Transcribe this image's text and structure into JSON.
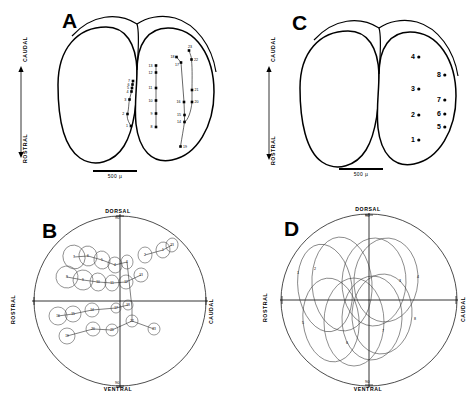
{
  "figure": {
    "panels": [
      "A",
      "B",
      "C",
      "D"
    ],
    "scale_bar_label": "500 µ"
  },
  "panel_a": {
    "letter": "A",
    "axis_top_label": "CAUDAL",
    "axis_bottom_label": "ROSTRAL",
    "scale_label": "500 µ",
    "view": "dorsal view of optic tectum with electrode penetration sites",
    "sites": [
      {
        "n": "1",
        "x": 131.0,
        "y": 126.0,
        "lx": -5.0,
        "ly": 1.2
      },
      {
        "n": "2",
        "x": 127.5,
        "y": 114.0,
        "lx": -5.2,
        "ly": 1.2
      },
      {
        "n": "3",
        "x": 129.5,
        "y": 99.5,
        "lx": -5.2,
        "ly": 1.2
      },
      {
        "n": "4",
        "x": 131.5,
        "y": 91.5,
        "lx": -5.0,
        "ly": 1.2
      },
      {
        "n": "5",
        "x": 132.0,
        "y": 88.0,
        "lx": -5.0,
        "ly": 1.2
      },
      {
        "n": "6",
        "x": 132.5,
        "y": 84.5,
        "lx": -5.0,
        "ly": 1.2
      },
      {
        "n": "7",
        "x": 133.0,
        "y": 81.0,
        "lx": -5.0,
        "ly": 1.2
      },
      {
        "n": "8",
        "x": 156.0,
        "y": 127.0,
        "lx": -5.6,
        "ly": 1.2
      },
      {
        "n": "9",
        "x": 156.0,
        "y": 113.5,
        "lx": -5.6,
        "ly": 1.2
      },
      {
        "n": "10",
        "x": 156.0,
        "y": 100.5,
        "lx": -7.4,
        "ly": 1.2
      },
      {
        "n": "11",
        "x": 156.0,
        "y": 88.0,
        "lx": -7.4,
        "ly": 1.2
      },
      {
        "n": "12",
        "x": 156.0,
        "y": 72.5,
        "lx": -7.4,
        "ly": 1.2
      },
      {
        "n": "13",
        "x": 156.0,
        "y": 65.5,
        "lx": -7.4,
        "ly": 1.2
      },
      {
        "n": "14",
        "x": 184.5,
        "y": 122.0,
        "lx": -7.6,
        "ly": 1.2
      },
      {
        "n": "15",
        "x": 184.5,
        "y": 115.0,
        "lx": -7.6,
        "ly": 1.2
      },
      {
        "n": "16",
        "x": 184.0,
        "y": 102.0,
        "lx": -7.6,
        "ly": 1.2
      },
      {
        "n": "17",
        "x": 181.0,
        "y": 62.5,
        "lx": -6.0,
        "ly": 3.0
      },
      {
        "n": "18",
        "x": 176.5,
        "y": 57.0,
        "lx": -6.0,
        "ly": 0.5
      },
      {
        "n": "19",
        "x": 180.5,
        "y": 146.5,
        "lx": 2.6,
        "ly": 1.6
      },
      {
        "n": "20",
        "x": 192.0,
        "y": 102.0,
        "lx": 2.6,
        "ly": 1.4
      },
      {
        "n": "21",
        "x": 192.0,
        "y": 90.0,
        "lx": 2.6,
        "ly": 1.4
      },
      {
        "n": "22",
        "x": 191.5,
        "y": 59.5,
        "lx": 2.6,
        "ly": 1.6
      },
      {
        "n": "23",
        "x": 189.0,
        "y": 50.5,
        "lx": -1.0,
        "ly": -2.4
      }
    ],
    "tracks": [
      "M131,126 C128.5,122 126.5,118 127.5,114 C129,108 128.5,104 129.5,99.5 L131.5,91.5 L132,88 L132.5,84.5 L133,81",
      "M156,127 L156,65.5",
      "M180.5,146.5 C182,137 183.5,129 184.5,122 L184.5,115 L184,102 L181,62.5 L176.5,57",
      "M189,50.5 C190.5,55 191.5,57 191.5,59.5 C192.5,70 192,82 192,90 L192,102 C191,112 188,120 184.5,122",
      "M176.5,57 L181,62.5"
    ]
  },
  "panel_b": {
    "letter": "B",
    "axis_top_label": "DORSAL",
    "axis_top_sub": "90",
    "axis_bottom_label": "VENTRAL",
    "axis_bottom_sub": "90",
    "axis_left_label": "ROSTRAL",
    "axis_right_label": "CAUDAL",
    "description": "visual field plot of receptive fields numbered to match panel A penetrations",
    "fields": [
      {
        "n": "7",
        "cx": 54,
        "cy": 45,
        "rx": 11,
        "ry": 12,
        "rot": -18
      },
      {
        "n": "6",
        "cx": 68,
        "cy": 44,
        "rx": 9,
        "ry": 10,
        "rot": -12
      },
      {
        "n": "5",
        "cx": 82,
        "cy": 48,
        "rx": 8,
        "ry": 9,
        "rot": -10
      },
      {
        "n": "4",
        "cx": 95,
        "cy": 53,
        "rx": 7,
        "ry": 8,
        "rot": -6
      },
      {
        "n": "3",
        "cx": 107,
        "cy": 50,
        "rx": 6,
        "ry": 7,
        "rot": 0
      },
      {
        "n": "2",
        "cx": 125,
        "cy": 43,
        "rx": 7,
        "ry": 8,
        "rot": 0
      },
      {
        "n": "1",
        "cx": 143,
        "cy": 38,
        "rx": 7,
        "ry": 8,
        "rot": 8
      },
      {
        "n": "23",
        "cx": 152,
        "cy": 33,
        "rx": 6,
        "ry": 7,
        "rot": 10
      },
      {
        "n": "8",
        "cx": 47,
        "cy": 65,
        "rx": 11,
        "ry": 11,
        "rot": -8
      },
      {
        "n": "9",
        "cx": 63,
        "cy": 68,
        "rx": 10,
        "ry": 10,
        "rot": -6
      },
      {
        "n": "10",
        "cx": 78,
        "cy": 70,
        "rx": 8,
        "ry": 9,
        "rot": -4
      },
      {
        "n": "11",
        "cx": 92,
        "cy": 71,
        "rx": 7,
        "ry": 8,
        "rot": 0
      },
      {
        "n": "12",
        "cx": 106,
        "cy": 70,
        "rx": 7,
        "ry": 7,
        "rot": 0
      },
      {
        "n": "13",
        "cx": 121,
        "cy": 63,
        "rx": 7,
        "ry": 7,
        "rot": 6
      },
      {
        "n": "16",
        "cx": 38,
        "cy": 104,
        "rx": 9,
        "ry": 9,
        "rot": 0
      },
      {
        "n": "15",
        "cx": 53,
        "cy": 102,
        "rx": 8,
        "ry": 8,
        "rot": 0
      },
      {
        "n": "14",
        "cx": 72,
        "cy": 98,
        "rx": 7,
        "ry": 7,
        "rot": 0
      },
      {
        "n": "17",
        "cx": 96,
        "cy": 96,
        "rx": 5,
        "ry": 5,
        "rot": 0
      },
      {
        "n": "18",
        "cx": 108,
        "cy": 93,
        "rx": 5,
        "ry": 5,
        "rot": 0
      },
      {
        "n": "19",
        "cx": 47,
        "cy": 124,
        "rx": 8,
        "ry": 8,
        "rot": 0
      },
      {
        "n": "20",
        "cx": 73,
        "cy": 117,
        "rx": 7,
        "ry": 7,
        "rot": 0
      },
      {
        "n": "21",
        "cx": 92,
        "cy": 118,
        "rx": 6,
        "ry": 6,
        "rot": 0
      },
      {
        "n": "22",
        "cx": 112,
        "cy": 109,
        "rx": 6,
        "ry": 6,
        "rot": 0
      },
      {
        "n": "23b",
        "cx": 134,
        "cy": 117,
        "rx": 6,
        "ry": 6,
        "rot": 0
      }
    ],
    "connectors": [
      "M54,45 L68,44 L82,48 L95,53 L107,50",
      "M107,50 L112,96",
      "M125,43 L143,38 L152,33",
      "M47,65 L63,68 L78,70 L92,71 L106,70 L121,63",
      "M38,104 L53,102 L72,98 L96,96 L108,93",
      "M47,124 L73,117 L92,118 L112,109 L134,117",
      "M112,109 L112,96"
    ]
  },
  "panel_c": {
    "letter": "C",
    "axis_top_label": "CAUDAL",
    "axis_bottom_label": "ROSTRAL",
    "scale_label": "500 µ",
    "view": "dorsal view of optic tectum with eight recording sites",
    "sites": [
      {
        "n": "4",
        "x": 179,
        "y": 57
      },
      {
        "n": "8",
        "x": 205,
        "y": 75
      },
      {
        "n": "3",
        "x": 179,
        "y": 89
      },
      {
        "n": "7",
        "x": 205,
        "y": 100
      },
      {
        "n": "2",
        "x": 179,
        "y": 115
      },
      {
        "n": "6",
        "x": 205,
        "y": 114
      },
      {
        "n": "5",
        "x": 205,
        "y": 127
      },
      {
        "n": "1",
        "x": 179,
        "y": 140
      }
    ]
  },
  "panel_d": {
    "letter": "D",
    "axis_top_label": "DORSAL",
    "axis_top_sub": "90",
    "axis_bottom_label": "VENTRAL",
    "axis_bottom_sub": "90",
    "axis_left_label": "ROSTRAL",
    "axis_right_label": "CAUDAL",
    "description": "visual field plot of eight large overlapping receptive fields",
    "fields": [
      {
        "n": "1",
        "cx": 55,
        "cy": 78,
        "rx": 27,
        "ry": 44,
        "rot": -8,
        "lx": 27,
        "ly": 64
      },
      {
        "n": "2",
        "cx": 72,
        "cy": 74,
        "rx": 30,
        "ry": 47,
        "rot": -4,
        "lx": 44,
        "ly": 60
      },
      {
        "n": "3",
        "cx": 104,
        "cy": 72,
        "rx": 32,
        "ry": 44,
        "rot": 2,
        "lx": 129,
        "ly": 72
      },
      {
        "n": "4",
        "cx": 116,
        "cy": 70,
        "rx": 32,
        "ry": 42,
        "rot": 4,
        "lx": 147,
        "ly": 68
      },
      {
        "n": "5",
        "cx": 61,
        "cy": 110,
        "rx": 28,
        "ry": 42,
        "rot": -6,
        "lx": 32,
        "ly": 114
      },
      {
        "n": "6",
        "cx": 84,
        "cy": 112,
        "rx": 30,
        "ry": 44,
        "rot": 0,
        "lx": 76,
        "ly": 134
      },
      {
        "n": "7",
        "cx": 102,
        "cy": 108,
        "rx": 30,
        "ry": 42,
        "rot": 2,
        "lx": 112,
        "ly": 122
      },
      {
        "n": "8",
        "cx": 112,
        "cy": 104,
        "rx": 30,
        "ry": 40,
        "rot": 4,
        "lx": 144,
        "ly": 110
      }
    ]
  }
}
